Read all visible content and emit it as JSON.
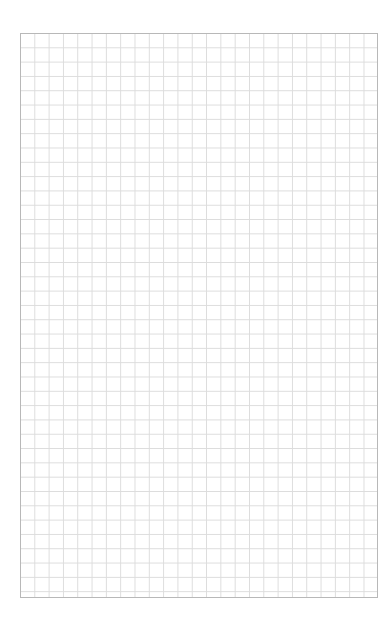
{
  "page": {
    "type": "grid-paper",
    "grid": {
      "columns": 25,
      "rows": 39,
      "line_color": "#dcdcdc",
      "border_color": "#b8b8b8",
      "background": "#ffffff"
    }
  }
}
